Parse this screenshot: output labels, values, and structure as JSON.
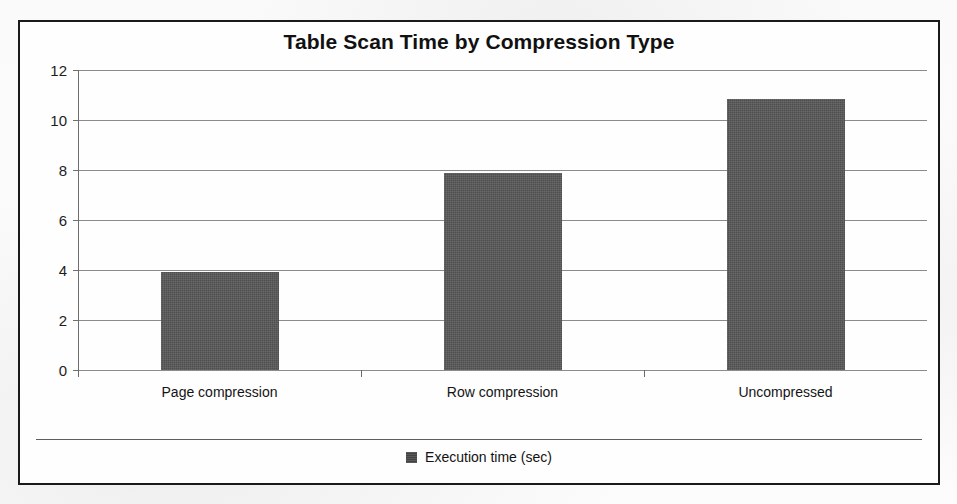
{
  "chart_data": {
    "type": "bar",
    "title": "Table Scan Time by Compression Type",
    "categories": [
      "Page compression",
      "Row compression",
      "Uncompressed"
    ],
    "series": [
      {
        "name": "Execution time (sec)",
        "values": [
          3.93,
          7.88,
          10.85
        ]
      }
    ],
    "values": [
      3.93,
      7.88,
      10.85
    ],
    "xlabel": "",
    "ylabel": "",
    "ylim": [
      0,
      12
    ],
    "ytick_labels": [
      "12",
      "10",
      "8",
      "6",
      "4",
      "2",
      "0"
    ],
    "ytick_values": [
      12,
      10,
      8,
      6,
      4,
      2,
      0
    ],
    "grid": true,
    "legend_position": "bottom",
    "bar_color": "#575757",
    "gridline_color": "#8b8b8b",
    "border_color": "#1a1a1a",
    "background_color": "#fefefe"
  },
  "legend": {
    "entries": [
      {
        "label": "Execution time (sec)",
        "color": "#474747",
        "marker": "square-marker"
      }
    ]
  }
}
